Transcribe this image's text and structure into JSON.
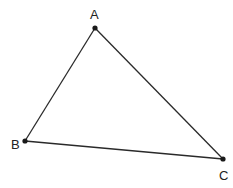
{
  "diagram": {
    "type": "triangle",
    "stroke_color": "#2a2a2a",
    "point_color": "#1a1a1a",
    "vertices": {
      "A": {
        "label": "A",
        "x": 95,
        "y": 28,
        "label_x": 90,
        "label_y": 19
      },
      "B": {
        "label": "B",
        "x": 25,
        "y": 141,
        "label_x": 11,
        "label_y": 149
      },
      "C": {
        "label": "C",
        "x": 223,
        "y": 159,
        "label_x": 219,
        "label_y": 180
      }
    },
    "edges": [
      {
        "from": "A",
        "to": "B"
      },
      {
        "from": "B",
        "to": "C"
      },
      {
        "from": "C",
        "to": "A"
      }
    ]
  }
}
